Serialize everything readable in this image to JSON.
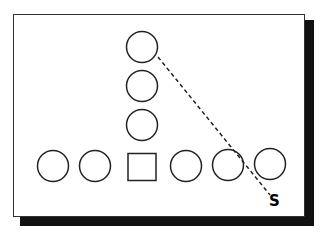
{
  "diagram": {
    "type": "football-play",
    "frame": {
      "border_color": "#333333",
      "shadow_color": "#111111",
      "background": "#ffffff"
    },
    "players": [
      {
        "id": "back-1",
        "shape": "circle",
        "cx": 142,
        "cy": 47
      },
      {
        "id": "back-2",
        "shape": "circle",
        "cx": 142,
        "cy": 86
      },
      {
        "id": "back-3",
        "shape": "circle",
        "cx": 142,
        "cy": 125
      },
      {
        "id": "line-1",
        "shape": "circle",
        "cx": 53,
        "cy": 166
      },
      {
        "id": "line-2",
        "shape": "circle",
        "cx": 95,
        "cy": 166
      },
      {
        "id": "center",
        "shape": "square",
        "cx": 142,
        "cy": 167
      },
      {
        "id": "line-4",
        "shape": "circle",
        "cx": 186,
        "cy": 166
      },
      {
        "id": "line-5",
        "shape": "circle",
        "cx": 228,
        "cy": 165
      },
      {
        "id": "line-6",
        "shape": "circle",
        "cx": 270,
        "cy": 164
      }
    ],
    "route": {
      "from": [
        158,
        57
      ],
      "to": [
        270,
        195
      ],
      "style": "dashed"
    },
    "label": {
      "text": "S",
      "x": 269,
      "y": 194
    }
  }
}
